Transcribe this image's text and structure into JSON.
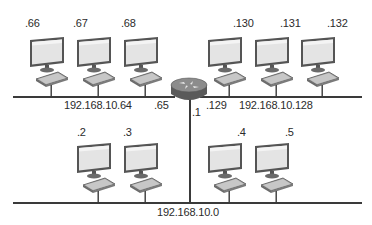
{
  "diagram": {
    "type": "network-topology",
    "router": {
      "name": "router",
      "interfaces": [
        {
          "label": ".65",
          "network": "192.168.10.64"
        },
        {
          "label": ".129",
          "network": "192.168.10.128"
        },
        {
          "label": ".1",
          "network": "192.168.10.0"
        }
      ]
    },
    "segments": [
      {
        "id": "top-left",
        "network_label": "192.168.10.64",
        "hosts": [
          ".66",
          ".67",
          ".68"
        ]
      },
      {
        "id": "top-right",
        "network_label": "192.168.10.128",
        "hosts": [
          ".130",
          ".131",
          ".132"
        ]
      },
      {
        "id": "bottom",
        "network_label": "192.168.10.0",
        "hosts": [
          ".2",
          ".3",
          ".4",
          ".5"
        ]
      }
    ],
    "colors": {
      "line": "#3a3a3a",
      "monitor_frame": "#4a4a4a",
      "monitor_screen": "#e6e6e6",
      "router_body": "#7a7a7a"
    }
  }
}
